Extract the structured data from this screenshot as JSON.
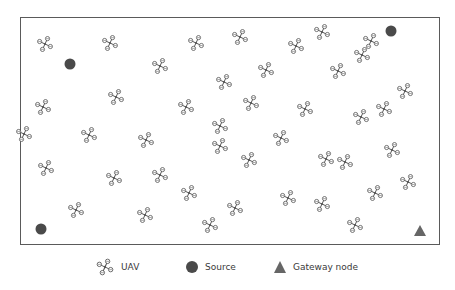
{
  "figure": {
    "type": "UAV network deployment diagram",
    "frame": {
      "x": 20,
      "y": 17,
      "width": 420,
      "height": 228
    }
  },
  "colors": {
    "uav": "#555555",
    "source": "#4a4a4a",
    "gateway": "#666666",
    "border": "#5a5a5a",
    "legend_text": "#3a3a3a"
  },
  "nodes": {
    "uavs": [
      {
        "x": 45,
        "y": 44
      },
      {
        "x": 110,
        "y": 43
      },
      {
        "x": 196,
        "y": 43
      },
      {
        "x": 240,
        "y": 37
      },
      {
        "x": 322,
        "y": 32
      },
      {
        "x": 160,
        "y": 66
      },
      {
        "x": 296,
        "y": 46
      },
      {
        "x": 362,
        "y": 55
      },
      {
        "x": 266,
        "y": 70
      },
      {
        "x": 371,
        "y": 41
      },
      {
        "x": 43,
        "y": 107
      },
      {
        "x": 116,
        "y": 97
      },
      {
        "x": 186,
        "y": 107
      },
      {
        "x": 224,
        "y": 82
      },
      {
        "x": 338,
        "y": 71
      },
      {
        "x": 405,
        "y": 91
      },
      {
        "x": 89,
        "y": 135
      },
      {
        "x": 146,
        "y": 140
      },
      {
        "x": 251,
        "y": 103
      },
      {
        "x": 384,
        "y": 109
      },
      {
        "x": 46,
        "y": 168
      },
      {
        "x": 114,
        "y": 178
      },
      {
        "x": 220,
        "y": 126
      },
      {
        "x": 305,
        "y": 109
      },
      {
        "x": 361,
        "y": 117
      },
      {
        "x": 24,
        "y": 134
      },
      {
        "x": 281,
        "y": 138
      },
      {
        "x": 189,
        "y": 193
      },
      {
        "x": 326,
        "y": 159
      },
      {
        "x": 392,
        "y": 150
      },
      {
        "x": 220,
        "y": 146
      },
      {
        "x": 249,
        "y": 160
      },
      {
        "x": 345,
        "y": 162
      },
      {
        "x": 408,
        "y": 182
      },
      {
        "x": 76,
        "y": 210
      },
      {
        "x": 145,
        "y": 215
      },
      {
        "x": 288,
        "y": 198
      },
      {
        "x": 235,
        "y": 208
      },
      {
        "x": 322,
        "y": 204
      },
      {
        "x": 375,
        "y": 193
      },
      {
        "x": 210,
        "y": 225
      },
      {
        "x": 355,
        "y": 225
      },
      {
        "x": 160,
        "y": 175
      }
    ],
    "sources": [
      {
        "x": 70,
        "y": 64
      },
      {
        "x": 391,
        "y": 31
      },
      {
        "x": 41,
        "y": 229
      }
    ],
    "gateways": [
      {
        "x": 420,
        "y": 231
      }
    ]
  },
  "legend": {
    "items": [
      {
        "icon": "uav-icon",
        "label": "UAV"
      },
      {
        "icon": "source-icon",
        "label": "Source"
      },
      {
        "icon": "gateway-icon",
        "label": "Gateway node"
      }
    ]
  }
}
